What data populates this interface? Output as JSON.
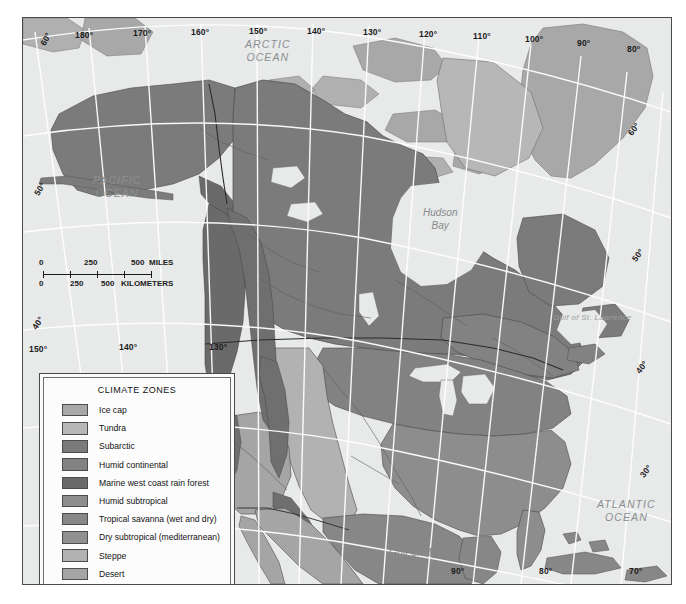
{
  "map": {
    "title": "CLIMATE ZONES",
    "region": "North America",
    "projection_note": "graticule",
    "frame_color": "#4a4a4a",
    "ocean_color": "#e8e9e9",
    "graticule_color": "#ffffff"
  },
  "legend": {
    "title": "CLIMATE ZONES",
    "items": [
      {
        "label": "Ice cap",
        "color": "#a8a8a8"
      },
      {
        "label": "Tundra",
        "color": "#b7b7b7"
      },
      {
        "label": "Subarctic",
        "color": "#7b7b7b"
      },
      {
        "label": "Humid continental",
        "color": "#828282"
      },
      {
        "label": "Marine west coast rain forest",
        "color": "#6a6a6a"
      },
      {
        "label": "Humid subtropical",
        "color": "#8d8d8d"
      },
      {
        "label": "Tropical savanna (wet and dry)",
        "color": "#878787"
      },
      {
        "label": "Dry subtropical (mediterranean)",
        "color": "#909090"
      },
      {
        "label": "Steppe",
        "color": "#b2b2b2"
      },
      {
        "label": "Desert",
        "color": "#a5a5a5"
      },
      {
        "label": "Highland",
        "color": "#6f6f6f"
      }
    ]
  },
  "scale_bar": {
    "miles": {
      "ticks": [
        "0",
        "250",
        "500"
      ],
      "unit": "MILES"
    },
    "kilometers": {
      "ticks": [
        "0",
        "250",
        "500"
      ],
      "unit": "KILOMETERS"
    }
  },
  "coordinates": {
    "top": [
      "180°",
      "170°",
      "160°",
      "150°",
      "140°",
      "130°",
      "120°",
      "110°",
      "100°",
      "90°",
      "80°"
    ],
    "left": [
      "60°",
      "50°",
      "40°"
    ],
    "left_lower": [
      "150°",
      "140°",
      "130°",
      "120°"
    ],
    "right": [
      "60°",
      "50°",
      "40°",
      "30°"
    ],
    "bottom": [
      "90°",
      "80°",
      "70°"
    ]
  },
  "water_labels": {
    "arctic": "ARCTIC\nOCEAN",
    "arctic_line1": "ARCTIC",
    "arctic_line2": "OCEAN",
    "pacific_line1": "PACIFIC",
    "pacific_line2": "OCEAN",
    "atlantic_line1": "ATLANTIC",
    "atlantic_line2": "OCEAN",
    "hudson_line1": "Hudson",
    "hudson_line2": "Bay",
    "gulf_of_mexico": "Gulf of Mexico",
    "gulf_of_st_lawrence": "Gulf of St. Lawrence"
  }
}
